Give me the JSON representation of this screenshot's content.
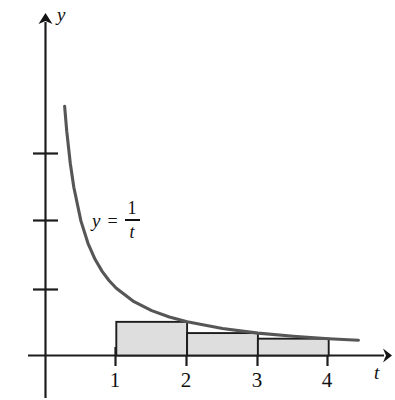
{
  "figure": {
    "equation": {
      "lhs": "y",
      "operator": "=",
      "numerator": "1",
      "denominator": "t"
    },
    "axes": {
      "y_axis_name": "y",
      "x_axis_name": "t",
      "x_tick_labels": [
        "1",
        "2",
        "3",
        "4"
      ],
      "y_tick_labels": [
        "",
        "",
        ""
      ]
    },
    "colors": {
      "axis": "#1d1d1d",
      "curve": "#565656",
      "rect_fill": "#dedede",
      "rect_stroke": "#1d1d1d",
      "background": "#ffffff"
    }
  },
  "chart_data": {
    "type": "line",
    "title": "",
    "subtitle": "",
    "xlabel": "t",
    "ylabel": "y",
    "xlim": [
      -0.25,
      4.85
    ],
    "ylim": [
      -0.7,
      5.1
    ],
    "grid": false,
    "legend": null,
    "annotations": [
      {
        "text": "y = 1/t",
        "x": 1.05,
        "y": 2.05
      }
    ],
    "x_ticks": [
      1,
      2,
      3,
      4
    ],
    "x_tick_labels": [
      "1",
      "2",
      "3",
      "4"
    ],
    "y_ticks": [
      1,
      2,
      3
    ],
    "y_tick_labels": [
      "",
      "",
      ""
    ],
    "series": [
      {
        "name": "y = 1/t",
        "type": "line",
        "color": "#565656",
        "x_domain": [
          0.27,
          4.42
        ],
        "points": [
          {
            "t": 0.27,
            "y": 3.704
          },
          {
            "t": 0.3,
            "y": 3.333
          },
          {
            "t": 0.35,
            "y": 2.857
          },
          {
            "t": 0.4,
            "y": 2.5
          },
          {
            "t": 0.5,
            "y": 2.0
          },
          {
            "t": 0.6,
            "y": 1.667
          },
          {
            "t": 0.7,
            "y": 1.429
          },
          {
            "t": 0.8,
            "y": 1.25
          },
          {
            "t": 0.9,
            "y": 1.111
          },
          {
            "t": 1.0,
            "y": 1.0
          },
          {
            "t": 1.25,
            "y": 0.8
          },
          {
            "t": 1.5,
            "y": 0.667
          },
          {
            "t": 1.75,
            "y": 0.571
          },
          {
            "t": 2.0,
            "y": 0.5
          },
          {
            "t": 2.5,
            "y": 0.4
          },
          {
            "t": 3.0,
            "y": 0.333
          },
          {
            "t": 3.5,
            "y": 0.286
          },
          {
            "t": 4.0,
            "y": 0.25
          },
          {
            "t": 4.42,
            "y": 0.226
          }
        ]
      },
      {
        "name": "right-endpoint rectangles",
        "type": "bar",
        "fill": "#dedede",
        "stroke": "#1d1d1d",
        "bars": [
          {
            "x_left": 1,
            "x_right": 2,
            "height": 0.5,
            "label": "1/2"
          },
          {
            "x_left": 2,
            "x_right": 3,
            "height": 0.3333,
            "label": "1/3"
          },
          {
            "x_left": 3,
            "x_right": 4,
            "height": 0.25,
            "label": "1/4"
          }
        ]
      }
    ]
  }
}
